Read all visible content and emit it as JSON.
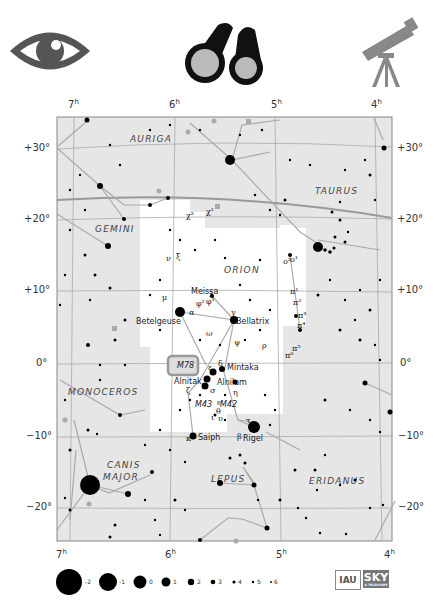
{
  "header": {
    "icons": [
      {
        "name": "naked-eye-icon",
        "color": "#555555"
      },
      {
        "name": "binoculars-icon",
        "color": "#111111"
      },
      {
        "name": "telescope-icon",
        "color": "#888888"
      }
    ]
  },
  "chart": {
    "ra_labels_top": [
      "7h",
      "6h",
      "5h",
      "4h"
    ],
    "ra_labels_bottom": [
      "7h",
      "6h",
      "5h",
      "4h"
    ],
    "dec_labels_left": [
      "+30°",
      "+20°",
      "+10°",
      "0°",
      "−10°",
      "−20°"
    ],
    "dec_labels_right": [
      "+30°",
      "+20°",
      "+10°",
      "0°",
      "−10°",
      "−20°"
    ],
    "constellations": [
      "AURIGA",
      "TAURUS",
      "GEMINI",
      "ORION",
      "MONOCEROS",
      "CANIS MAJOR",
      "LEPUS",
      "ERIDANUS"
    ],
    "star_labels": [
      "Betelgeuse",
      "Bellatrix",
      "Meissa",
      "Mintaka",
      "Alnitak",
      "Alnilam",
      "Saiph",
      "Rigel"
    ],
    "greek_labels": [
      "α",
      "γ",
      "δ",
      "ε",
      "ζ",
      "η",
      "β",
      "κ",
      "λ",
      "μ",
      "ν",
      "ξ",
      "ω",
      "ψ",
      "ρ",
      "σ",
      "τ",
      "ι",
      "υ",
      "θ",
      "φ¹",
      "φ²",
      "χ¹",
      "χ²",
      "ο¹",
      "ο²",
      "π¹",
      "π²",
      "π³",
      "π⁴",
      "π⁵",
      "π⁶"
    ],
    "deep_sky": [
      "M78",
      "M42",
      "M43"
    ],
    "colors": {
      "background": "#e6e6e6",
      "orion_region": "#ffffff",
      "lines": "#999999",
      "stars": "#000000",
      "highlight": "#9a9a9a"
    }
  },
  "legend": {
    "title": "magnitude scale",
    "magnitudes": [
      "-2",
      "-1",
      "0",
      "1",
      "2",
      "3",
      "4",
      "5",
      "6"
    ]
  },
  "logos": {
    "iau": "IAU",
    "sky": "SKY",
    "sky_sub": "& TELESCOPE"
  }
}
